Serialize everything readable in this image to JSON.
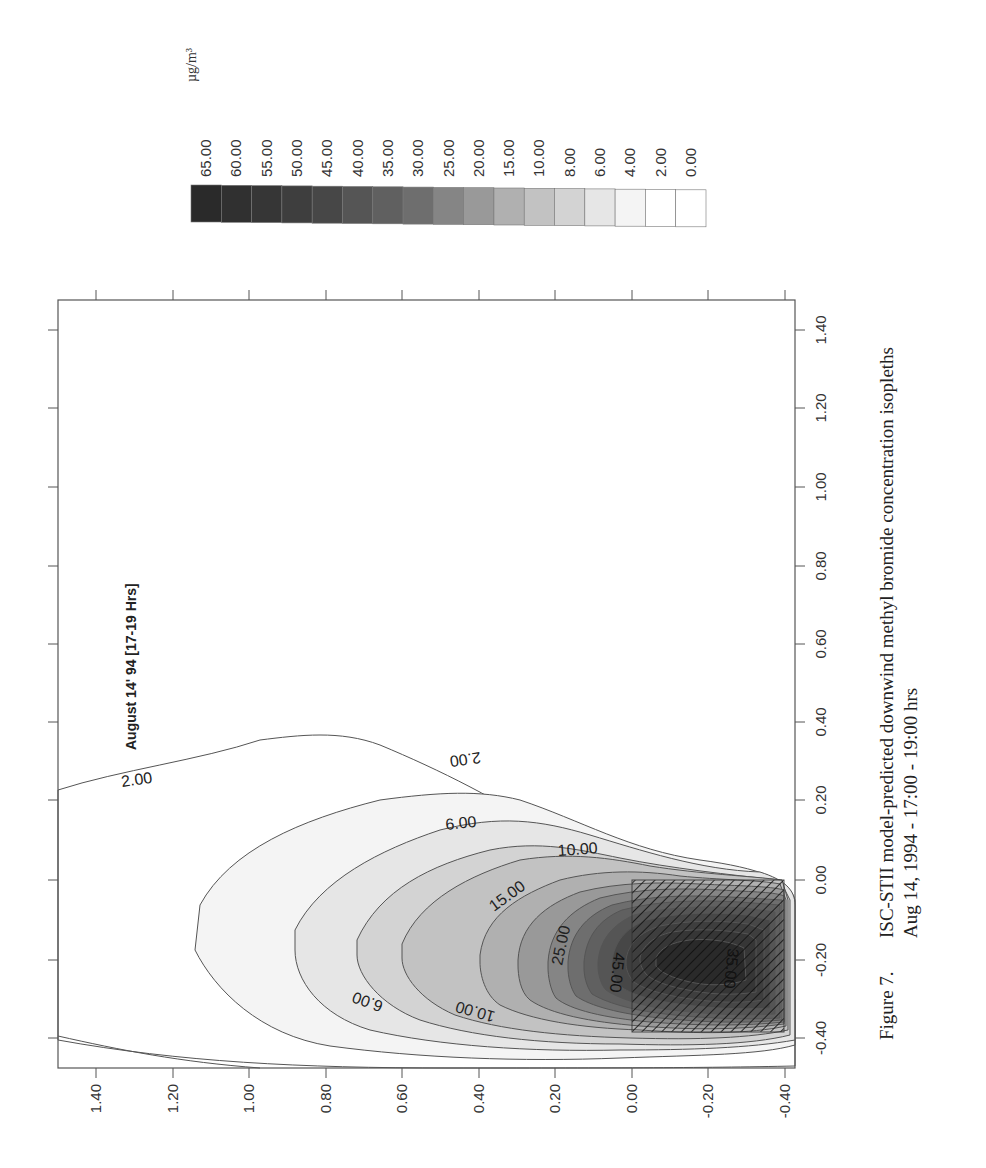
{
  "figure": {
    "caption_number": "Figure 7.",
    "caption_line1": "ISC-STII model-predicted downwind methyl bromide concentration isopleths",
    "caption_line2": "Aug 14, 1994 - 17:00 - 19:00 hrs",
    "annotation": "August 14' 94 [17-19 Hrs]"
  },
  "legend": {
    "unit": "µg/m³",
    "levels": [
      {
        "label": "65.00",
        "color": "#2a2a2a"
      },
      {
        "label": "60.00",
        "color": "#303030"
      },
      {
        "label": "55.00",
        "color": "#363636"
      },
      {
        "label": "50.00",
        "color": "#3e3e3e"
      },
      {
        "label": "45.00",
        "color": "#474747"
      },
      {
        "label": "40.00",
        "color": "#555555"
      },
      {
        "label": "35.00",
        "color": "#606060"
      },
      {
        "label": "30.00",
        "color": "#6e6e6e"
      },
      {
        "label": "25.00",
        "color": "#858585"
      },
      {
        "label": "20.00",
        "color": "#999999"
      },
      {
        "label": "15.00",
        "color": "#b0b0b0"
      },
      {
        "label": "10.00",
        "color": "#c2c2c2"
      },
      {
        "label": "8.00",
        "color": "#d3d3d3"
      },
      {
        "label": "6.00",
        "color": "#e6e6e6"
      },
      {
        "label": "4.00",
        "color": "#f4f4f4"
      },
      {
        "label": "2.00",
        "color": "#ffffff"
      },
      {
        "label": "0.00",
        "color": "#ffffff"
      }
    ]
  },
  "axes": {
    "bottom_ticks": [
      "1.40",
      "1.20",
      "1.00",
      "0.80",
      "0.60",
      "0.40",
      "0.20",
      "0.00",
      "-0.20",
      "-0.40"
    ],
    "right_ticks": [
      "1.40",
      "1.20",
      "1.00",
      "0.80",
      "0.60",
      "0.40",
      "0.20",
      "0.00",
      "-0.20",
      "-0.40"
    ]
  },
  "contour_labels": [
    {
      "text": "2.00"
    },
    {
      "text": "2.00"
    },
    {
      "text": "6.00"
    },
    {
      "text": "6.00"
    },
    {
      "text": "10.00"
    },
    {
      "text": "10.00"
    },
    {
      "text": "15.00"
    },
    {
      "text": "25.00"
    },
    {
      "text": "45.00"
    },
    {
      "text": "35.00"
    }
  ],
  "chart_data": {
    "type": "heatmap",
    "subtype": "contour",
    "title": "ISC-STII model-predicted downwind methyl bromide concentration isopleths",
    "subtitle": "Aug 14, 1994 - 17:00 - 19:00 hrs",
    "annotation": "August 14' 94 [17-19 Hrs]",
    "units": "µg/m³",
    "orientation": "page rotated 90° counter-clockwise",
    "x_ticks": [
      -0.4,
      -0.2,
      0.0,
      0.2,
      0.4,
      0.6,
      0.8,
      1.0,
      1.2,
      1.4
    ],
    "y_ticks": [
      -0.4,
      -0.2,
      0.0,
      0.2,
      0.4,
      0.6,
      0.8,
      1.0,
      1.2,
      1.4
    ],
    "xlim": [
      -0.5,
      1.5
    ],
    "ylim": [
      -0.45,
      1.5
    ],
    "contour_levels": [
      0,
      2,
      4,
      6,
      8,
      10,
      15,
      20,
      25,
      30,
      35,
      40,
      45,
      50,
      55,
      60,
      65
    ],
    "labeled_contours": [
      2.0,
      6.0,
      10.0,
      15.0,
      25.0,
      35.0,
      45.0
    ],
    "source_area": {
      "x": [
        -0.38,
        0.0
      ],
      "y": [
        -0.38,
        0.0
      ],
      "style": "hatched"
    },
    "peak_region": {
      "x_approx": -0.15,
      "y_approx": -0.15,
      "max_level": 65
    },
    "legend_position": "top (rotated: right side of page)",
    "grid": false
  }
}
